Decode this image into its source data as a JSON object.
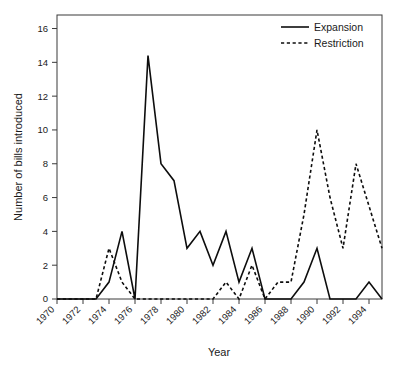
{
  "chart_data": {
    "type": "line",
    "title": "",
    "xlabel": "Year",
    "ylabel": "Number of bills introduced",
    "xlim": [
      1970,
      1995
    ],
    "ylim": [
      0,
      16.8
    ],
    "grid": false,
    "legend_position": "top-right",
    "x": [
      1970,
      1971,
      1972,
      1973,
      1974,
      1975,
      1976,
      1977,
      1978,
      1979,
      1980,
      1981,
      1982,
      1983,
      1984,
      1985,
      1986,
      1987,
      1988,
      1989,
      1990,
      1991,
      1992,
      1993,
      1994,
      1995
    ],
    "xticks": [
      1970,
      1972,
      1974,
      1976,
      1978,
      1980,
      1982,
      1984,
      1986,
      1988,
      1990,
      1992,
      1994
    ],
    "xtick_labels": [
      "1970",
      "1972",
      "1974",
      "1976",
      "1978",
      "1980",
      "1982",
      "1984",
      "1986",
      "1988",
      "1990",
      "1992",
      "1994"
    ],
    "yticks": [
      0,
      2,
      4,
      6,
      8,
      10,
      12,
      14,
      16
    ],
    "ytick_labels": [
      "0",
      "2",
      "4",
      "6",
      "8",
      "10",
      "12",
      "14",
      "16"
    ],
    "series": [
      {
        "name": "Expansion",
        "style": "solid",
        "color": "#0d0d0d",
        "values": [
          0,
          0,
          0,
          0,
          1,
          4,
          0,
          14.4,
          8,
          7,
          3,
          4,
          2,
          4,
          1,
          3,
          0,
          0,
          0,
          1,
          3,
          0,
          0,
          0,
          1,
          0
        ]
      },
      {
        "name": "Restriction",
        "style": "dashed",
        "color": "#0d0d0d",
        "values": [
          0,
          0,
          0,
          0,
          3,
          1,
          0,
          0,
          0,
          0,
          0,
          0,
          0,
          1,
          0,
          2,
          0,
          1,
          1,
          5,
          10,
          6,
          3,
          8,
          5.5,
          3
        ]
      }
    ]
  },
  "legend": {
    "items": [
      {
        "label": "Expansion",
        "style": "solid"
      },
      {
        "label": "Restriction",
        "style": "dashed"
      }
    ]
  }
}
